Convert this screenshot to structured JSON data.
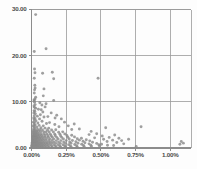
{
  "chart_data": {
    "type": "scatter",
    "title": "",
    "xlabel": "",
    "ylabel": "",
    "xlim": [
      0.0,
      0.0115
    ],
    "ylim": [
      0.0,
      30.0
    ],
    "grid": true,
    "legend": null,
    "x_tick_labels": [
      "0.00%",
      "0.25%",
      "0.50%",
      "0.75%",
      "1.00%"
    ],
    "x_tick_values": [
      0.0,
      0.0025,
      0.005,
      0.0075,
      0.01
    ],
    "y_tick_labels": [
      "0.00",
      "10.00",
      "20.00",
      "30.00"
    ],
    "y_tick_values": [
      0.0,
      10.0,
      20.0,
      30.0
    ],
    "marker_color": "#8a8a8a",
    "grid_color": "#9a9a9a",
    "axis_color": "#8c8c8c",
    "points": [
      [
        0.0003,
        28.9
      ],
      [
        0.0002,
        20.9
      ],
      [
        0.00105,
        21.5
      ],
      [
        0.00022,
        17.1
      ],
      [
        0.00025,
        16.3
      ],
      [
        0.0008,
        16.2
      ],
      [
        0.0015,
        16.4
      ],
      [
        0.0002,
        15.1
      ],
      [
        0.0016,
        15.0
      ],
      [
        0.0048,
        15.1
      ],
      [
        0.00024,
        13.6
      ],
      [
        0.00026,
        13.0
      ],
      [
        0.00022,
        12.6
      ],
      [
        0.0009,
        12.8
      ],
      [
        0.0002,
        11.9
      ],
      [
        0.00085,
        11.3
      ],
      [
        0.0003,
        11.0
      ],
      [
        0.00025,
        10.6
      ],
      [
        0.00018,
        10.4
      ],
      [
        0.0002,
        10.2
      ],
      [
        0.0016,
        10.3
      ],
      [
        0.00022,
        9.9
      ],
      [
        0.0006,
        9.8
      ],
      [
        0.00105,
        9.6
      ],
      [
        0.00026,
        9.4
      ],
      [
        0.00018,
        9.1
      ],
      [
        0.00021,
        8.8
      ],
      [
        0.0003,
        8.6
      ],
      [
        0.0005,
        8.4
      ],
      [
        0.0007,
        8.3
      ],
      [
        0.00019,
        8.1
      ],
      [
        0.00024,
        7.9
      ],
      [
        0.00082,
        7.8
      ],
      [
        0.00017,
        7.6
      ],
      [
        0.00028,
        7.4
      ],
      [
        0.00064,
        7.2
      ],
      [
        0.0002,
        7.0
      ],
      [
        0.00042,
        6.9
      ],
      [
        0.0009,
        6.7
      ],
      [
        0.00016,
        6.5
      ],
      [
        0.00025,
        6.4
      ],
      [
        0.00058,
        6.3
      ],
      [
        0.0017,
        6.5
      ],
      [
        0.00019,
        6.1
      ],
      [
        0.00032,
        5.9
      ],
      [
        0.00076,
        5.8
      ],
      [
        0.00014,
        5.6
      ],
      [
        0.00022,
        5.5
      ],
      [
        0.00046,
        5.4
      ],
      [
        0.00108,
        5.3
      ],
      [
        0.0013,
        5.5
      ],
      [
        0.00018,
        5.1
      ],
      [
        0.00027,
        5.0
      ],
      [
        0.00055,
        4.9
      ],
      [
        0.00085,
        4.8
      ],
      [
        0.00013,
        4.7
      ],
      [
        0.00021,
        4.6
      ],
      [
        0.00038,
        4.5
      ],
      [
        0.00068,
        4.4
      ],
      [
        0.00098,
        4.3
      ],
      [
        0.00124,
        4.3
      ],
      [
        0.00016,
        4.2
      ],
      [
        0.00024,
        4.1
      ],
      [
        0.00044,
        4.0
      ],
      [
        0.0006,
        3.95
      ],
      [
        0.00079,
        3.9
      ],
      [
        0.00115,
        3.85
      ],
      [
        0.00145,
        3.9
      ],
      [
        0.00175,
        3.95
      ],
      [
        0.00012,
        3.8
      ],
      [
        0.00019,
        3.75
      ],
      [
        0.00029,
        3.7
      ],
      [
        0.00036,
        3.65
      ],
      [
        0.0005,
        3.6
      ],
      [
        0.00066,
        3.55
      ],
      [
        0.00088,
        3.5
      ],
      [
        0.00104,
        3.5
      ],
      [
        0.00128,
        3.45
      ],
      [
        0.00158,
        3.45
      ],
      [
        0.00196,
        3.4
      ],
      [
        0.00225,
        3.5
      ],
      [
        0.0001,
        3.35
      ],
      [
        0.00015,
        3.3
      ],
      [
        0.00022,
        3.25
      ],
      [
        0.00031,
        3.2
      ],
      [
        0.0004,
        3.18
      ],
      [
        0.00053,
        3.15
      ],
      [
        0.00071,
        3.1
      ],
      [
        0.00092,
        3.05
      ],
      [
        0.00112,
        3.05
      ],
      [
        0.00136,
        3.0
      ],
      [
        0.00168,
        3.0
      ],
      [
        0.00205,
        3.0
      ],
      [
        0.0024,
        3.05
      ],
      [
        0.00011,
        2.9
      ],
      [
        0.00017,
        2.88
      ],
      [
        0.00023,
        2.85
      ],
      [
        0.00028,
        2.82
      ],
      [
        0.00035,
        2.8
      ],
      [
        0.00046,
        2.78
      ],
      [
        0.00058,
        2.75
      ],
      [
        0.00074,
        2.72
      ],
      [
        0.00096,
        2.7
      ],
      [
        0.00118,
        2.68
      ],
      [
        0.00142,
        2.65
      ],
      [
        0.00172,
        2.65
      ],
      [
        0.0021,
        2.62
      ],
      [
        0.00255,
        2.7
      ],
      [
        0.0029,
        2.75
      ],
      [
        9e-05,
        2.55
      ],
      [
        0.00014,
        2.52
      ],
      [
        0.0002,
        2.5
      ],
      [
        0.00026,
        2.48
      ],
      [
        0.00033,
        2.46
      ],
      [
        0.00042,
        2.44
      ],
      [
        0.00052,
        2.42
      ],
      [
        0.00065,
        2.4
      ],
      [
        0.00081,
        2.38
      ],
      [
        0.001,
        2.36
      ],
      [
        0.00122,
        2.34
      ],
      [
        0.0015,
        2.32
      ],
      [
        0.00182,
        2.3
      ],
      [
        0.00218,
        2.3
      ],
      [
        0.00262,
        2.32
      ],
      [
        0.0031,
        2.4
      ],
      [
        8e-05,
        2.2
      ],
      [
        0.00013,
        2.18
      ],
      [
        0.00018,
        2.16
      ],
      [
        0.00024,
        2.14
      ],
      [
        0.0003,
        2.12
      ],
      [
        0.00038,
        2.1
      ],
      [
        0.00048,
        2.08
      ],
      [
        0.0006,
        2.06
      ],
      [
        0.00073,
        2.04
      ],
      [
        0.00089,
        2.02
      ],
      [
        0.00108,
        2.0
      ],
      [
        0.00132,
        1.98
      ],
      [
        0.0016,
        1.96
      ],
      [
        0.00192,
        1.95
      ],
      [
        0.0023,
        1.95
      ],
      [
        0.00272,
        1.96
      ],
      [
        0.0033,
        2.0
      ],
      [
        0.0036,
        2.1
      ],
      [
        7e-05,
        1.85
      ],
      [
        0.00012,
        1.83
      ],
      [
        0.00016,
        1.81
      ],
      [
        0.00021,
        1.8
      ],
      [
        0.00027,
        1.78
      ],
      [
        0.00034,
        1.76
      ],
      [
        0.00043,
        1.74
      ],
      [
        0.00054,
        1.72
      ],
      [
        0.00067,
        1.7
      ],
      [
        0.00083,
        1.68
      ],
      [
        0.00101,
        1.66
      ],
      [
        0.00124,
        1.64
      ],
      [
        0.00148,
        1.62
      ],
      [
        0.00178,
        1.6
      ],
      [
        0.00212,
        1.6
      ],
      [
        0.0025,
        1.6
      ],
      [
        0.00295,
        1.62
      ],
      [
        0.00345,
        1.7
      ],
      [
        0.00395,
        1.8
      ],
      [
        6e-05,
        1.5
      ],
      [
        0.0001,
        1.48
      ],
      [
        0.00015,
        1.46
      ],
      [
        0.00019,
        1.45
      ],
      [
        0.00025,
        1.43
      ],
      [
        0.00031,
        1.42
      ],
      [
        0.00039,
        1.4
      ],
      [
        0.00049,
        1.38
      ],
      [
        0.00061,
        1.36
      ],
      [
        0.00075,
        1.35
      ],
      [
        0.00092,
        1.33
      ],
      [
        0.00111,
        1.32
      ],
      [
        0.00134,
        1.3
      ],
      [
        0.00162,
        1.28
      ],
      [
        0.00195,
        1.28
      ],
      [
        0.00232,
        1.28
      ],
      [
        0.00275,
        1.3
      ],
      [
        0.0032,
        1.35
      ],
      [
        0.00372,
        1.45
      ],
      [
        0.0042,
        1.55
      ],
      [
        5e-05,
        1.2
      ],
      [
        9e-05,
        1.18
      ],
      [
        0.00013,
        1.16
      ],
      [
        0.00017,
        1.15
      ],
      [
        0.00022,
        1.13
      ],
      [
        0.00028,
        1.12
      ],
      [
        0.00035,
        1.1
      ],
      [
        0.00044,
        1.09
      ],
      [
        0.00055,
        1.08
      ],
      [
        0.00068,
        1.06
      ],
      [
        0.00084,
        1.05
      ],
      [
        0.00102,
        1.04
      ],
      [
        0.00123,
        1.03
      ],
      [
        0.00147,
        1.02
      ],
      [
        0.00176,
        1.01
      ],
      [
        0.00208,
        1.0
      ],
      [
        0.00245,
        1.0
      ],
      [
        0.00285,
        1.02
      ],
      [
        0.00335,
        1.05
      ],
      [
        0.00385,
        1.15
      ],
      [
        0.0044,
        1.25
      ],
      [
        4e-05,
        0.9
      ],
      [
        8e-05,
        0.88
      ],
      [
        0.00011,
        0.86
      ],
      [
        0.00015,
        0.85
      ],
      [
        0.0002,
        0.84
      ],
      [
        0.00025,
        0.82
      ],
      [
        0.00032,
        0.81
      ],
      [
        0.0004,
        0.8
      ],
      [
        0.0005,
        0.79
      ],
      [
        0.00062,
        0.78
      ],
      [
        0.00076,
        0.77
      ],
      [
        0.00093,
        0.76
      ],
      [
        0.00112,
        0.75
      ],
      [
        0.00135,
        0.74
      ],
      [
        0.00162,
        0.73
      ],
      [
        0.00193,
        0.72
      ],
      [
        0.00228,
        0.72
      ],
      [
        0.00268,
        0.73
      ],
      [
        0.00312,
        0.75
      ],
      [
        0.00362,
        0.8
      ],
      [
        0.00415,
        0.9
      ],
      [
        0.0047,
        1.0
      ],
      [
        3e-05,
        0.6
      ],
      [
        6e-05,
        0.58
      ],
      [
        9e-05,
        0.57
      ],
      [
        0.00013,
        0.56
      ],
      [
        0.00017,
        0.55
      ],
      [
        0.00022,
        0.54
      ],
      [
        0.00028,
        0.53
      ],
      [
        0.00035,
        0.52
      ],
      [
        0.00044,
        0.51
      ],
      [
        0.00055,
        0.5
      ],
      [
        0.00068,
        0.5
      ],
      [
        0.00082,
        0.49
      ],
      [
        0.001,
        0.48
      ],
      [
        0.0012,
        0.48
      ],
      [
        0.00144,
        0.47
      ],
      [
        0.00172,
        0.47
      ],
      [
        0.00204,
        0.46
      ],
      [
        0.0024,
        0.46
      ],
      [
        0.0028,
        0.47
      ],
      [
        0.00325,
        0.5
      ],
      [
        0.00375,
        0.55
      ],
      [
        0.00428,
        0.62
      ],
      [
        0.00485,
        0.72
      ],
      [
        2e-05,
        0.3
      ],
      [
        5e-05,
        0.29
      ],
      [
        8e-05,
        0.28
      ],
      [
        0.00011,
        0.28
      ],
      [
        0.00015,
        0.27
      ],
      [
        0.00019,
        0.26
      ],
      [
        0.00024,
        0.26
      ],
      [
        0.0003,
        0.25
      ],
      [
        0.00038,
        0.25
      ],
      [
        0.00047,
        0.24
      ],
      [
        0.00058,
        0.24
      ],
      [
        0.00071,
        0.23
      ],
      [
        0.00086,
        0.23
      ],
      [
        0.00104,
        0.22
      ],
      [
        0.00125,
        0.22
      ],
      [
        0.0015,
        0.22
      ],
      [
        0.00178,
        0.21
      ],
      [
        0.0021,
        0.21
      ],
      [
        0.00246,
        0.21
      ],
      [
        0.00286,
        0.22
      ],
      [
        0.0033,
        0.25
      ],
      [
        0.0038,
        0.3
      ],
      [
        0.00432,
        0.35
      ],
      [
        0.0049,
        0.42
      ],
      [
        0.0051,
        2.6
      ],
      [
        0.00535,
        4.4
      ],
      [
        0.0052,
        1.9
      ],
      [
        0.00545,
        1.4
      ],
      [
        0.0056,
        2.3
      ],
      [
        0.00585,
        1.7
      ],
      [
        0.006,
        2.8
      ],
      [
        0.00615,
        1.2
      ],
      [
        0.0063,
        2.1
      ],
      [
        0.0065,
        1.6
      ],
      [
        0.00505,
        0.8
      ],
      [
        0.00548,
        0.6
      ],
      [
        0.00592,
        0.55
      ],
      [
        0.00665,
        0.9
      ],
      [
        0.007,
        1.9
      ],
      [
        0.00755,
        0.35
      ],
      [
        0.0079,
        4.6
      ],
      [
        0.0108,
        1.4
      ],
      [
        0.01095,
        1.05
      ],
      [
        0.0107,
        0.8
      ],
      [
        0.00415,
        2.9
      ],
      [
        0.0043,
        3.6
      ],
      [
        0.00455,
        2.2
      ],
      [
        0.0047,
        3.1
      ],
      [
        0.00345,
        4.1
      ],
      [
        0.00308,
        5.2
      ],
      [
        0.0029,
        4.0
      ],
      [
        0.00265,
        4.8
      ],
      [
        0.00238,
        5.6
      ],
      [
        0.00215,
        6.3
      ],
      [
        0.00198,
        4.6
      ],
      [
        0.00182,
        7.1
      ],
      [
        0.00168,
        5.1
      ],
      [
        0.00142,
        7.6
      ],
      [
        0.00118,
        6.8
      ],
      [
        0.00098,
        8.9
      ],
      [
        0.00075,
        9.3
      ]
    ]
  },
  "caption": {
    "text": "",
    "visible": false
  }
}
